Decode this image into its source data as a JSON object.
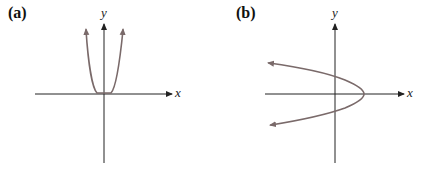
{
  "colors": {
    "axis": "#222222",
    "curve": "#7a6a6a",
    "background": "#ffffff"
  },
  "panels": [
    {
      "label": "(a)",
      "x_axis_label": "x",
      "y_axis_label": "y",
      "curve": "U-shaped even-degree curve (like y = x^4), flat at origin, both ends pointing up with arrows"
    },
    {
      "label": "(b)",
      "x_axis_label": "x",
      "y_axis_label": "y",
      "curve": "Parabola opening to the left (like x = -y^2 + c), vertex on positive x-axis, both ends pointing left with arrows"
    }
  ]
}
